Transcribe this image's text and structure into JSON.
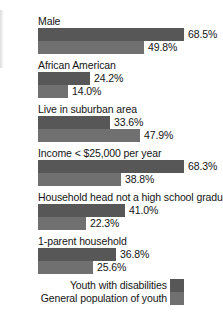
{
  "chart_data": {
    "type": "bar",
    "orientation": "horizontal",
    "title": "",
    "xlabel": "",
    "ylabel": "",
    "xlim": [
      0,
      100
    ],
    "grid": false,
    "legend_position": "bottom-right",
    "value_suffix": "%",
    "categories": [
      "Male",
      "African American",
      "Live in suburban area",
      "Income < $25,000 per year",
      "Household head not a high school graduate",
      "1-parent household"
    ],
    "series": [
      {
        "name": "Youth with disabilities",
        "color": "#575757",
        "values": [
          68.5,
          24.2,
          33.6,
          68.3,
          41.0,
          36.8
        ],
        "labels": [
          "68.5%",
          "24.2%",
          "33.6%",
          "68.3%",
          "41.0%",
          "36.8%"
        ]
      },
      {
        "name": "General population of youth",
        "color": "#707070",
        "values": [
          49.8,
          14.0,
          47.9,
          38.8,
          22.3,
          25.6
        ],
        "labels": [
          "49.8%",
          "14.0%",
          "47.9%",
          "38.8%",
          "22.3%",
          "25.6%"
        ]
      }
    ]
  },
  "legend": {
    "items": [
      {
        "label": "Youth with disabilities",
        "color": "#575757"
      },
      {
        "label": "General population of youth",
        "color": "#707070"
      }
    ]
  }
}
